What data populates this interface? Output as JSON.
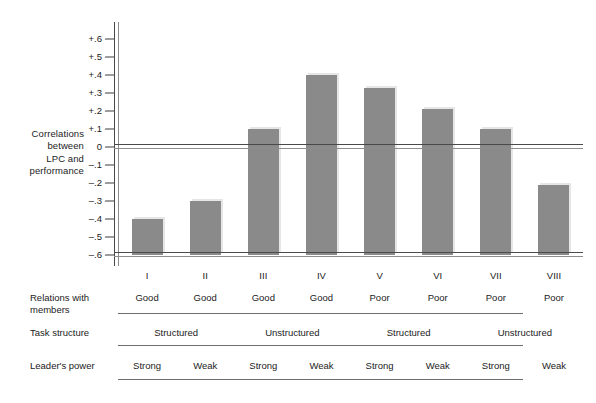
{
  "chart_data": {
    "type": "bar",
    "title": "",
    "xlabel": "",
    "ylabel": "Correlations between LPC and performance",
    "ylim": [
      -0.6,
      0.65
    ],
    "grid": false,
    "legend": "none",
    "categories": [
      "I",
      "II",
      "III",
      "IV",
      "V",
      "VI",
      "VII",
      "VIII"
    ],
    "values": [
      -0.4,
      -0.3,
      0.1,
      0.4,
      0.33,
      0.21,
      0.1,
      -0.21
    ],
    "ytick_labels": [
      "+.6",
      "+.5",
      "+.4",
      "+.3",
      "+.2",
      "+.1",
      "0",
      "–.1",
      "–.2",
      "–.3",
      "–.4",
      "–.5",
      "–.6"
    ],
    "ytick_values": [
      0.6,
      0.5,
      0.4,
      0.3,
      0.2,
      0.1,
      0.0,
      -0.1,
      -0.2,
      -0.3,
      -0.4,
      -0.5,
      -0.6
    ],
    "bar_color": "#8a8a8a",
    "axis_color": "#4a4a4a"
  },
  "y_axis_title_lines": [
    "Correlations",
    "between",
    "LPC and",
    "performance"
  ],
  "matrix": {
    "rows": [
      {
        "label": "Relations with members",
        "cells": [
          "Good",
          "Good",
          "Good",
          "Good",
          "Poor",
          "Poor",
          "Poor",
          "Poor"
        ],
        "spans": [
          1,
          1,
          1,
          1,
          1,
          1,
          1,
          1
        ]
      },
      {
        "label": "Task structure",
        "cells": [
          "Structured",
          "Unstructured",
          "Structured",
          "Unstructured"
        ],
        "spans": [
          2,
          2,
          2,
          2
        ]
      },
      {
        "label": "Leader's power",
        "cells": [
          "Strong",
          "Weak",
          "Strong",
          "Weak",
          "Strong",
          "Weak",
          "Strong",
          "Weak"
        ],
        "spans": [
          1,
          1,
          1,
          1,
          1,
          1,
          1,
          1
        ]
      }
    ]
  }
}
